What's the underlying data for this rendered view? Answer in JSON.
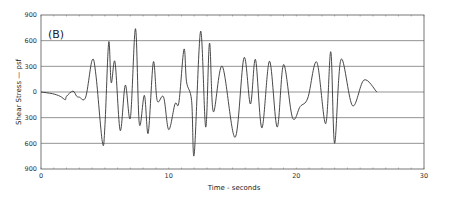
{
  "chart_data": {
    "type": "line",
    "panel_label": "(B)",
    "title": "",
    "xlabel": "Time - seconds",
    "ylabel": "Shear Stress — psf",
    "xlim": [
      0,
      30
    ],
    "ylim": [
      -900,
      900
    ],
    "x_ticks": [
      0,
      10,
      20,
      30
    ],
    "x_tick_labels": [
      "0",
      "10",
      "20",
      "30"
    ],
    "y_ticks": [
      900,
      600,
      300,
      0,
      -300,
      -600,
      -900
    ],
    "y_tick_labels": [
      "900",
      "600",
      "300",
      "0",
      "300",
      "600",
      "900"
    ],
    "grid": "horizontal",
    "legend": null,
    "series": [
      {
        "name": "Shear Stress",
        "color": "#333333",
        "x": [
          0,
          0.9,
          1.5,
          1.9,
          2.0,
          2.5,
          2.8,
          3.0,
          3.5,
          4.0,
          4.3,
          4.8,
          5.0,
          5.3,
          5.5,
          5.8,
          6.2,
          6.6,
          7.0,
          7.4,
          7.7,
          8.1,
          8.4,
          8.8,
          9.1,
          9.6,
          10.0,
          10.5,
          10.8,
          11.2,
          11.4,
          11.8,
          12.0,
          12.5,
          12.9,
          13.2,
          13.5,
          14.2,
          15.2,
          15.9,
          16.4,
          16.8,
          17.3,
          17.9,
          18.5,
          19.0,
          19.7,
          20.3,
          20.9,
          21.6,
          22.3,
          22.7,
          23.0,
          23.5,
          24.4,
          25.3,
          26.3,
          27.2,
          28.0,
          29.0,
          30.0
        ],
        "values": [
          0,
          -20,
          -50,
          -90,
          -50,
          10,
          -50,
          -60,
          -60,
          370,
          200,
          -580,
          -420,
          580,
          110,
          350,
          -450,
          80,
          -300,
          740,
          -370,
          -40,
          -480,
          350,
          -100,
          -60,
          -440,
          -140,
          -120,
          500,
          120,
          -100,
          -730,
          710,
          -410,
          570,
          -230,
          300,
          -530,
          400,
          -140,
          380,
          -420,
          360,
          -410,
          320,
          -300,
          -170,
          -70,
          350,
          -370,
          470,
          -600,
          380,
          -160,
          140,
          0,
          0,
          0,
          0,
          0
        ]
      }
    ]
  },
  "labels": {
    "panel": "(B)",
    "xlabel": "Time - seconds",
    "ylabel": "Shear  Stress — psf"
  }
}
